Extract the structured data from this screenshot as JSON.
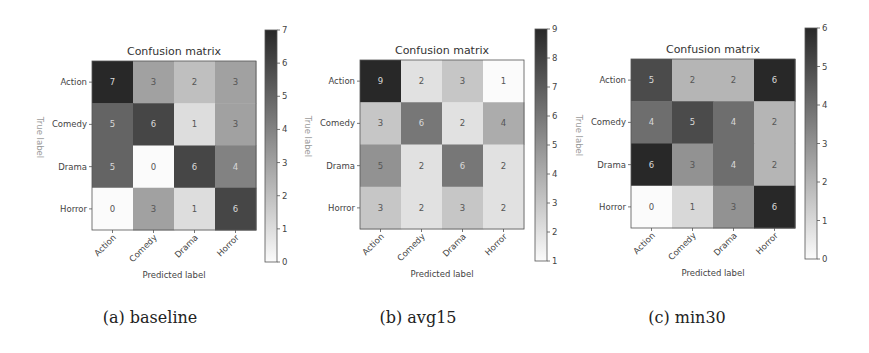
{
  "chart_data": [
    {
      "type": "heatmap",
      "id": "a",
      "title": "Confusion matrix",
      "caption": "(a) baseline",
      "xlabel": "Predicted label",
      "ylabel": "True label",
      "x_categories": [
        "Action",
        "Comedy",
        "Drama",
        "Horror"
      ],
      "y_categories": [
        "Action",
        "Comedy",
        "Drama",
        "Horror"
      ],
      "values": [
        [
          7,
          3,
          2,
          3
        ],
        [
          5,
          6,
          1,
          3
        ],
        [
          5,
          0,
          6,
          4
        ],
        [
          0,
          3,
          1,
          6
        ]
      ],
      "colorbar": {
        "range": [
          0,
          7
        ],
        "ticks": [
          "0",
          "1",
          "2",
          "3",
          "4",
          "5",
          "6",
          "7"
        ]
      },
      "colormap": "greys"
    },
    {
      "type": "heatmap",
      "id": "b",
      "title": "Confusion matrix",
      "caption": "(b) avg15",
      "xlabel": "Predicted label",
      "ylabel": "True label",
      "x_categories": [
        "Action",
        "Comedy",
        "Drama",
        "Horror"
      ],
      "y_categories": [
        "Action",
        "Comedy",
        "Drama",
        "Horror"
      ],
      "values": [
        [
          9,
          2,
          3,
          1
        ],
        [
          3,
          6,
          2,
          4
        ],
        [
          5,
          2,
          6,
          2
        ],
        [
          3,
          2,
          3,
          2
        ]
      ],
      "colorbar": {
        "range": [
          1,
          9
        ],
        "ticks": [
          "1",
          "2",
          "3",
          "4",
          "5",
          "6",
          "7",
          "8",
          "9"
        ]
      },
      "colormap": "greys"
    },
    {
      "type": "heatmap",
      "id": "c",
      "title": "Confusion matrix",
      "caption": "(c) min30",
      "xlabel": "Predicted label",
      "ylabel": "True label",
      "x_categories": [
        "Action",
        "Comedy",
        "Drama",
        "Horror"
      ],
      "y_categories": [
        "Action",
        "Comedy",
        "Drama",
        "Horror"
      ],
      "values": [
        [
          5,
          2,
          2,
          6
        ],
        [
          4,
          5,
          4,
          2
        ],
        [
          6,
          3,
          4,
          2
        ],
        [
          0,
          1,
          3,
          6
        ]
      ],
      "colorbar": {
        "range": [
          0,
          6
        ],
        "ticks": [
          "0",
          "1",
          "2",
          "3",
          "4",
          "5",
          "6"
        ]
      },
      "colormap": "greys"
    }
  ],
  "colors": {
    "dark": "#2e2e2e",
    "light": "#fbfbfb",
    "text_on_dark": "#d9d9d9",
    "text_on_light": "#555555"
  }
}
